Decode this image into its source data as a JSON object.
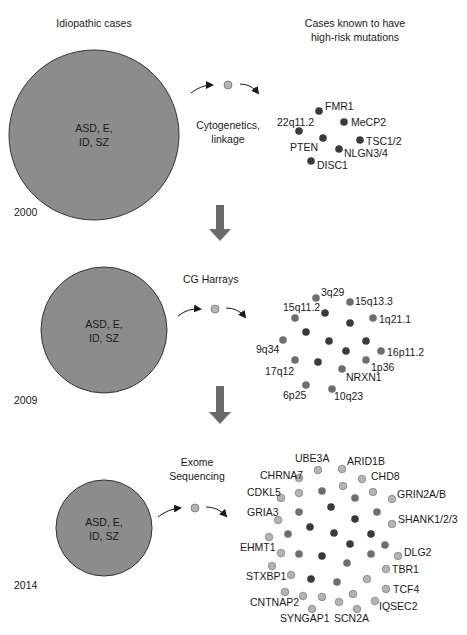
{
  "headers": {
    "left": "Idiopathic cases",
    "right_line1": "Cases known to have",
    "right_line2": "high-risk mutations"
  },
  "colors": {
    "big_circle": "#8c8c8c",
    "dark_dot": "#3a3a3a",
    "mid_dot": "#6e6e6e",
    "light_dot": "#b4b4b4",
    "arrow_block": "#6a6a6a"
  },
  "panels": [
    {
      "year": "2000",
      "circle_line1": "ASD, E,",
      "circle_line2": "ID, SZ",
      "method_line1": "Cytogenetics,",
      "method_line2": "linkage",
      "genes": [
        "FMR1",
        "MeCP2",
        "22q11.2",
        "PTEN",
        "TSC1/2",
        "NLGN3/4",
        "DISC1"
      ]
    },
    {
      "year": "2009",
      "circle_line1": "ASD, E,",
      "circle_line2": "ID, SZ",
      "method_line1": "CG Harrays",
      "method_line2": "",
      "genes": [
        "3q29",
        "15q13.3",
        "15q11.2",
        "1q21.1",
        "9q34",
        "16p11.2",
        "17q12",
        "1p36",
        "NRXN1",
        "6p25",
        "10q23"
      ]
    },
    {
      "year": "2014",
      "circle_line1": "ASD, E,",
      "circle_line2": "ID, SZ",
      "method_line1": "Exome",
      "method_line2": "Sequencing",
      "genes": [
        "UBE3A",
        "ARID1B",
        "CHRNA7",
        "CHD8",
        "CDKL5",
        "GRIN2A/B",
        "GRIA3",
        "SHANK1/2/3",
        "EHMT1",
        "DLG2",
        "TBR1",
        "STXBP1",
        "TCF4",
        "CNTNAP2",
        "IQSEC2",
        "SYNGAP1",
        "SCN2A"
      ]
    }
  ]
}
